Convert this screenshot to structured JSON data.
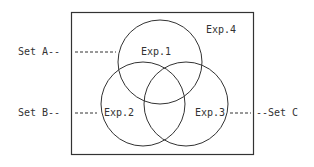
{
  "diagram": {
    "type": "venn",
    "universe_label": "Exp.4",
    "circles": [
      {
        "id": "exp1",
        "label": "Exp.1",
        "set": "Set A"
      },
      {
        "id": "exp2",
        "label": "Exp.2",
        "set": "Set B"
      },
      {
        "id": "exp3",
        "label": "Exp.3",
        "set": "Set C"
      }
    ],
    "set_labels": {
      "a": "Set A--",
      "b": "Set B--",
      "c": "--Set C"
    },
    "colors": {
      "stroke": "#333333",
      "background": "#ffffff"
    }
  }
}
